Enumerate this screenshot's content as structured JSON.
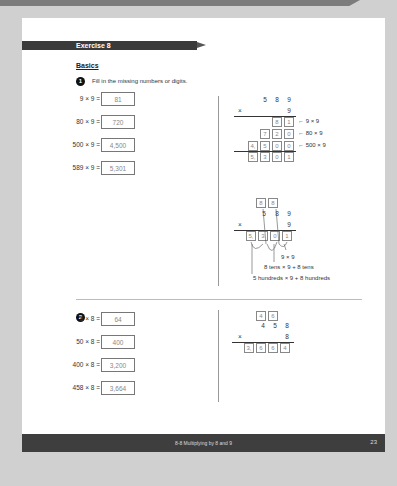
{
  "page": {
    "exercise_title": "Exercise 8",
    "section": "Basics",
    "footer_title": "8-8 Multiplying by 8 and 9",
    "page_number": "23"
  },
  "q1": {
    "number": "1",
    "instruction": "Fill in the missing numbers or digits.",
    "equations": [
      {
        "expr": "9 × 9 =",
        "answer": "81"
      },
      {
        "expr": "80 × 9 =",
        "answer": "720"
      },
      {
        "expr": "500 × 9 =",
        "answer": "4,500"
      },
      {
        "expr": "589 × 9 =",
        "answer": "5,301"
      }
    ],
    "vertical1": {
      "multiplicand": [
        "5",
        "8",
        "9"
      ],
      "times": "×",
      "multiplier": "9",
      "rows": [
        {
          "cells": [
            "8",
            "1"
          ],
          "note": "← 9 × 9"
        },
        {
          "cells": [
            "7",
            "2",
            "0"
          ],
          "note": "← 80 × 9"
        },
        {
          "cells": [
            "4,",
            "5",
            "0",
            "0"
          ],
          "note": "← 500 × 9"
        }
      ],
      "result": [
        "5,",
        "3",
        "0",
        "1"
      ]
    },
    "vertical2": {
      "carries": [
        "8",
        "8"
      ],
      "multiplicand": [
        "5",
        "8",
        "9"
      ],
      "times": "×",
      "multiplier": "9",
      "result": [
        "5,",
        "3",
        "0",
        "1"
      ],
      "notes": [
        "9 × 9",
        "8 tens × 9 + 8 tens",
        "5 hundreds × 9 + 8 hundreds"
      ]
    }
  },
  "q2": {
    "number": "2",
    "equations": [
      {
        "expr": "8 × 8 =",
        "answer": "64"
      },
      {
        "expr": "50 × 8 =",
        "answer": "400"
      },
      {
        "expr": "400 × 8 =",
        "answer": "3,200"
      },
      {
        "expr": "458 × 8 =",
        "answer": "3,664"
      }
    ],
    "vertical": {
      "carries": [
        "4",
        "6"
      ],
      "multiplicand": [
        "4",
        "5",
        "8"
      ],
      "times": "×",
      "multiplier": "8",
      "result": [
        "3,",
        "6",
        "6",
        "4"
      ]
    }
  }
}
